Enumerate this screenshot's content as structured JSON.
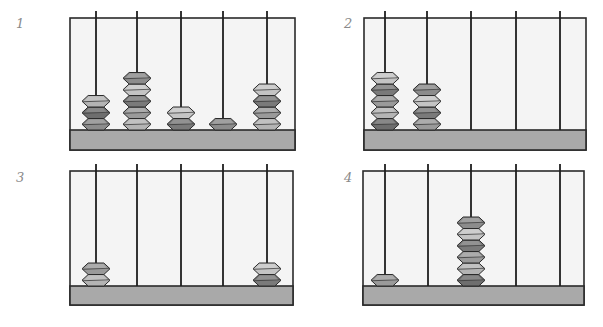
{
  "figure": {
    "colors": {
      "frame_fill": "#f4f4f4",
      "frame_stroke": "#2a2a2a",
      "base_fill": "#a9a9a9",
      "rod": "#1e1e1e",
      "bead_shades": [
        "#8c8c8c",
        "#6e6e6e",
        "#b4b4b4",
        "#9a9a9a",
        "#7a7a7a",
        "#c4c4c4"
      ],
      "label": "#8a8a8a"
    },
    "abaci": [
      {
        "label": "1",
        "rods": 5,
        "beads_per_rod": [
          3,
          5,
          2,
          1,
          4
        ],
        "frame": {
          "x": 70,
          "y": 18,
          "w": 225,
          "h": 132
        },
        "base_top": 130,
        "rod_x": [
          96,
          137,
          181,
          223,
          267
        ],
        "label_pos": {
          "x": 16,
          "y": 16
        }
      },
      {
        "label": "2",
        "rods": 5,
        "beads_per_rod": [
          5,
          4,
          0,
          0,
          0
        ],
        "frame": {
          "x": 364,
          "y": 18,
          "w": 222,
          "h": 132
        },
        "base_top": 130,
        "rod_x": [
          385,
          427,
          471,
          516,
          560
        ],
        "label_pos": {
          "x": 344,
          "y": 16
        }
      },
      {
        "label": "3",
        "rods": 5,
        "beads_per_rod": [
          2,
          0,
          0,
          0,
          2
        ],
        "frame": {
          "x": 70,
          "y": 171,
          "w": 223,
          "h": 134
        },
        "base_top": 286,
        "rod_x": [
          96,
          137,
          181,
          223,
          267
        ],
        "label_pos": {
          "x": 16,
          "y": 170
        }
      },
      {
        "label": "4",
        "rods": 5,
        "beads_per_rod": [
          1,
          0,
          6,
          0,
          0
        ],
        "frame": {
          "x": 363,
          "y": 171,
          "w": 221,
          "h": 134
        },
        "base_top": 286,
        "rod_x": [
          385,
          428,
          471,
          516,
          560
        ],
        "label_pos": {
          "x": 344,
          "y": 170
        }
      }
    ]
  }
}
